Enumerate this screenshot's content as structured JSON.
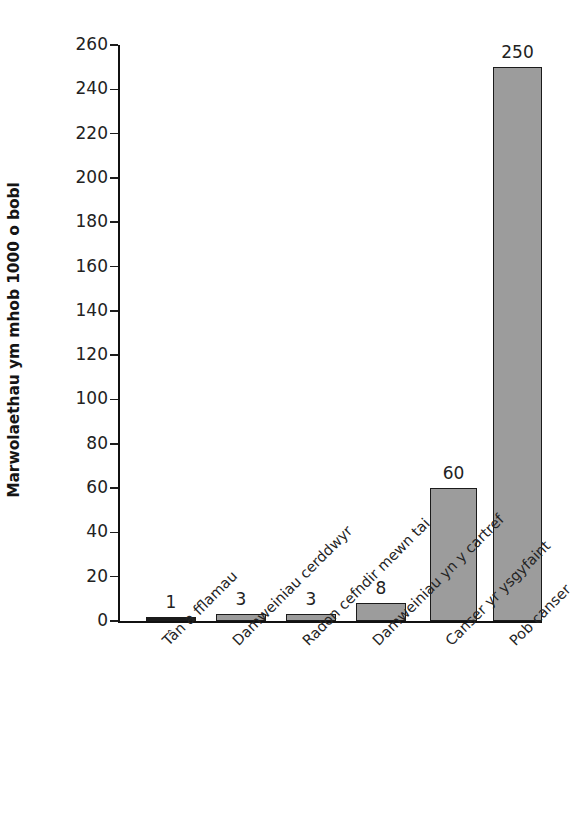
{
  "chart_data": {
    "type": "bar",
    "title": "",
    "subtitle": "",
    "xlabel": "",
    "ylabel": "Marwolaethau ym mhob 1000 o bobl",
    "categories": [
      "Tân a fflamau",
      "Damweiniau cerddwyr",
      "Radon cefndir mewn tai",
      "Damweiniau yn y cartref",
      "Canser yr ysgyfaint",
      "Pob canser"
    ],
    "values": [
      1,
      3,
      3,
      8,
      60,
      250
    ],
    "value_labels": [
      "1",
      "3",
      "3",
      "8",
      "60",
      "250"
    ],
    "ylim": [
      0,
      260
    ],
    "ytick_step": 20,
    "yticks": [
      0,
      20,
      40,
      60,
      80,
      100,
      120,
      140,
      160,
      180,
      200,
      220,
      240,
      260
    ],
    "ytick_labels": [
      "0",
      "20",
      "40",
      "60",
      "80",
      "100",
      "120",
      "140",
      "160",
      "180",
      "200",
      "220",
      "240",
      "260"
    ],
    "grid": false,
    "legend": false,
    "legend_position": "none",
    "bar_fill_color": "#9c9c9c",
    "bar_border_color": "#1b1b1b",
    "axis_color": "#111111",
    "text_color": "#222222",
    "background_color": "#ffffff"
  }
}
